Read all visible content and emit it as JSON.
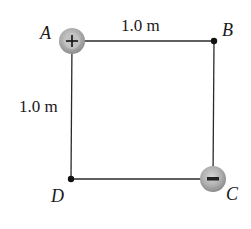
{
  "diagram": {
    "type": "square charge configuration",
    "points": [
      {
        "id": "A",
        "label": "A",
        "charge": "+",
        "has_charge": true
      },
      {
        "id": "B",
        "label": "B",
        "charge": "",
        "has_charge": false
      },
      {
        "id": "C",
        "label": "C",
        "charge": "-",
        "has_charge": true
      },
      {
        "id": "D",
        "label": "D",
        "charge": "",
        "has_charge": false
      }
    ],
    "dimensions": {
      "top_side": "1.0 m",
      "left_side": "1.0 m"
    },
    "colors": {
      "line": "#2a2a2a",
      "charge_fill": "#a8a8a8",
      "charge_edge": "#8a8a8a",
      "dot": "#111111"
    }
  }
}
